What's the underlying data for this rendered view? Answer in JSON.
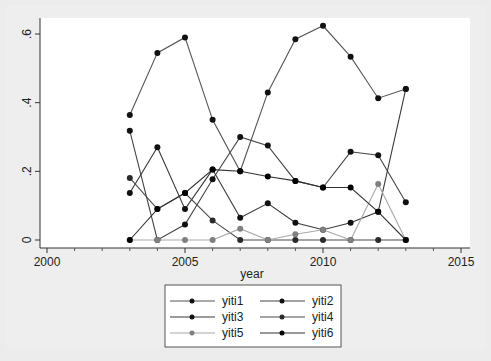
{
  "chart_data": {
    "type": "line",
    "title": "",
    "xlabel": "year",
    "ylabel": "",
    "x": [
      2003,
      2004,
      2005,
      2006,
      2007,
      2008,
      2009,
      2010,
      2011,
      2012,
      2013
    ],
    "xlim": [
      1999.7,
      2015.5
    ],
    "ylim": [
      -0.01,
      0.66
    ],
    "xticks": [
      2000,
      2005,
      2010,
      2015
    ],
    "xtick_labels": [
      "2000",
      "2005",
      "2010",
      "2015"
    ],
    "yticks": [
      0,
      0.2,
      0.4,
      0.6
    ],
    "ytick_labels": [
      "0",
      ".2",
      ".4",
      ".6"
    ],
    "grid": false,
    "legend_position": "bottom",
    "series": [
      {
        "name": "yiti1",
        "color": "#555555",
        "marker": "#111111",
        "values": [
          0.364,
          0.545,
          0.59,
          0.35,
          0.2,
          0.43,
          0.585,
          0.624,
          0.534,
          0.413,
          0.44
        ]
      },
      {
        "name": "yiti2",
        "color": "#444444",
        "marker": "#111111",
        "values": [
          0.318,
          0.0,
          0.045,
          0.177,
          0.3,
          0.275,
          0.172,
          0.153,
          0.257,
          0.247,
          0.11
        ]
      },
      {
        "name": "yiti3",
        "color": "#3a3a3a",
        "marker": "#111111",
        "values": [
          0.137,
          0.27,
          0.09,
          0.205,
          0.065,
          0.107,
          0.05,
          0.03,
          0.05,
          0.082,
          0.44
        ]
      },
      {
        "name": "yiti4",
        "color": "#4a4a4a",
        "marker": "#2a2a2a",
        "values": [
          0.181,
          0.09,
          0.137,
          0.057,
          0.0,
          0.0,
          0.0,
          0.0,
          0.0,
          0.0,
          0.0
        ]
      },
      {
        "name": "yiti5",
        "color": "#a8a8a8",
        "marker": "#808080",
        "values": [
          0.0,
          0.0,
          0.0,
          0.0,
          0.033,
          0.0,
          0.017,
          0.03,
          0.0,
          0.163,
          0.0
        ]
      },
      {
        "name": "yiti6",
        "color": "#333333",
        "marker": "#000000",
        "values": [
          0.0,
          0.09,
          0.137,
          0.205,
          0.2,
          0.185,
          0.172,
          0.153,
          0.153,
          0.082,
          0.0
        ]
      }
    ]
  },
  "legend": {
    "items": [
      "yiti1",
      "yiti2",
      "yiti3",
      "yiti4",
      "yiti5",
      "yiti6"
    ]
  },
  "axes": {
    "x_title": "year"
  }
}
